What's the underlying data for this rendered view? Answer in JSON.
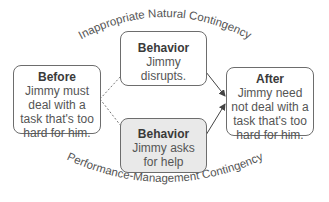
{
  "diagram": {
    "top_label": "Inappropriate Natural Contingency",
    "bottom_label": "Performance-Management Contingency",
    "before": {
      "title": "Before",
      "text": "Jimmy must deal with a task that's too hard for him."
    },
    "behavior_top": {
      "title": "Behavior",
      "text": "Jimmy disrupts."
    },
    "behavior_bottom": {
      "title": "Behavior",
      "text": "Jimmy asks for help"
    },
    "after": {
      "title": "After",
      "text": "Jimmy need not deal with a task that's too hard for him."
    },
    "colors": {
      "border": "#6d6d6d",
      "gray_fill": "#e9e9e9",
      "text": "#3a3a3a"
    }
  }
}
